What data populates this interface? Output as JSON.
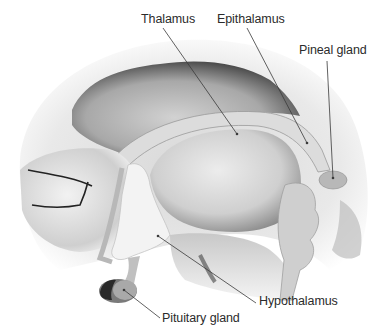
{
  "diagram": {
    "labels": [
      {
        "id": "thalamus",
        "text": "Thalamus",
        "x": 141,
        "y": 12,
        "line": [
          [
            163,
            28
          ],
          [
            237,
            134
          ]
        ]
      },
      {
        "id": "epithalamus",
        "text": "Epithalamus",
        "x": 217,
        "y": 12,
        "line": [
          [
            247,
            28
          ],
          [
            307,
            143
          ]
        ]
      },
      {
        "id": "pineal",
        "text": "Pineal gland",
        "x": 299,
        "y": 43,
        "line": [
          [
            327,
            61
          ],
          [
            333,
            178
          ]
        ]
      },
      {
        "id": "hypothalamus",
        "text": "Hypothalamus",
        "x": 259,
        "y": 294,
        "line": [
          [
            256,
            303
          ],
          [
            158,
            236
          ]
        ]
      },
      {
        "id": "pituitary",
        "text": "Pituitary gland",
        "x": 162,
        "y": 311,
        "line": [
          [
            160,
            318
          ],
          [
            124,
            290
          ]
        ]
      }
    ]
  }
}
